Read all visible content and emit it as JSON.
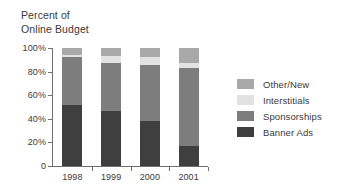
{
  "title": "Percent of\nOnline Budget",
  "chart_data": {
    "type": "bar",
    "stacked": true,
    "normalized_percent": true,
    "title": "Percent of Online Budget",
    "xlabel": "",
    "ylabel": "Percent of Online Budget",
    "categories": [
      "1998",
      "1999",
      "2000",
      "2001"
    ],
    "ylim": [
      0,
      100
    ],
    "yticks": [
      0,
      20,
      40,
      60,
      80,
      100
    ],
    "ytick_labels": [
      "0",
      "20%",
      "40%",
      "60%",
      "80%",
      "100%"
    ],
    "grid": false,
    "legend_position": "right",
    "series": [
      {
        "name": "Banner Ads",
        "color": "#3f3f3f",
        "values": [
          52,
          47,
          38,
          17
        ]
      },
      {
        "name": "Sponsorships",
        "color": "#7d7d7d",
        "values": [
          40,
          40,
          48,
          66
        ]
      },
      {
        "name": "Interstitials",
        "color": "#e2e2e2",
        "values": [
          2,
          6,
          6,
          4
        ]
      },
      {
        "name": "Other/New",
        "color": "#a9a9a9",
        "values": [
          6,
          7,
          8,
          13
        ]
      }
    ],
    "stack_order_bottom_to_top": [
      "Banner Ads",
      "Sponsorships",
      "Interstitials",
      "Other/New"
    ]
  },
  "legend": {
    "items": [
      {
        "label": "Other/New",
        "color": "#a9a9a9"
      },
      {
        "label": "Interstitials",
        "color": "#e2e2e2"
      },
      {
        "label": "Sponsorships",
        "color": "#7d7d7d"
      },
      {
        "label": "Banner Ads",
        "color": "#3f3f3f"
      }
    ]
  },
  "axis": {
    "line_color": "#6f6f6f"
  }
}
